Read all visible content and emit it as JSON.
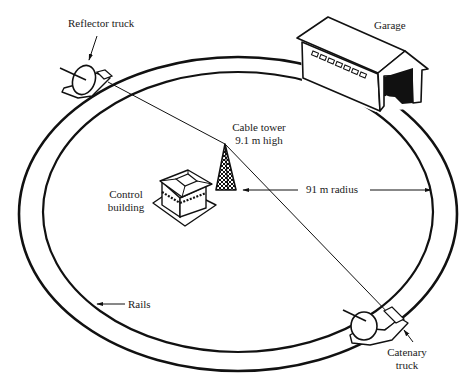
{
  "diagram": {
    "labels": {
      "reflector_truck": "Reflector truck",
      "garage": "Garage",
      "cable_tower_line1": "Cable tower",
      "cable_tower_line2": "9.1 m high",
      "control_line1": "Control",
      "control_line2": "building",
      "radius": "91 m radius",
      "rails": "Rails",
      "catenary_line1": "Catenary",
      "catenary_line2": "truck"
    },
    "measurements": {
      "tower_height": "9.1 m",
      "track_radius": "91 m"
    },
    "components": [
      "reflector-truck",
      "garage",
      "cable-tower",
      "control-building",
      "rails",
      "catenary-truck",
      "cable"
    ],
    "colors": {
      "ink": "#111111",
      "background": "#ffffff"
    }
  }
}
